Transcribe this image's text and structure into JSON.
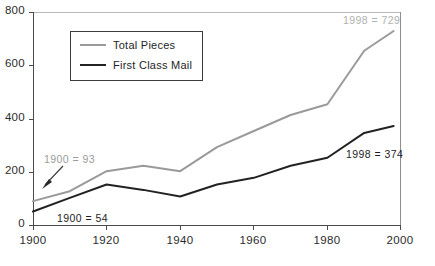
{
  "chart_data": {
    "type": "line",
    "title": "",
    "xlabel": "",
    "ylabel": "",
    "xlim": [
      1900,
      2000
    ],
    "ylim": [
      0,
      800
    ],
    "grid": false,
    "legend_position": "upper-left-inside",
    "x": [
      1900,
      1910,
      1920,
      1930,
      1940,
      1950,
      1960,
      1970,
      1980,
      1990,
      1998
    ],
    "xticks": [
      "1900",
      "1920",
      "1940",
      "1960",
      "1980",
      "2000"
    ],
    "xtick_values": [
      1900,
      1920,
      1940,
      1960,
      1980,
      2000
    ],
    "yticks": [
      "0",
      "200",
      "400",
      "600",
      "800"
    ],
    "ytick_values": [
      0,
      200,
      400,
      600,
      800
    ],
    "series": [
      {
        "name": "Total Pieces",
        "color": "#9a9a9a",
        "values": [
          93,
          130,
          205,
          225,
          205,
          295,
          355,
          415,
          455,
          655,
          729
        ]
      },
      {
        "name": "First Class Mail",
        "color": "#222222",
        "values": [
          54,
          105,
          155,
          135,
          110,
          155,
          180,
          225,
          255,
          348,
          374
        ]
      }
    ],
    "annotations": [
      {
        "id": "total-1998",
        "text": "1998 = 729",
        "color": "#b0b0b0",
        "series": "Total Pieces"
      },
      {
        "id": "total-1900",
        "text": "1900 = 93",
        "color": "#9b9b9b",
        "series": "Total Pieces",
        "arrow": true
      },
      {
        "id": "first-1900",
        "text": "1900 = 54",
        "color": "#1e1e1e",
        "series": "First Class Mail"
      },
      {
        "id": "first-1998",
        "text": "1998 = 374",
        "color": "#1e1e1e",
        "series": "First Class Mail"
      }
    ]
  },
  "legend": {
    "items": [
      {
        "label": "Total Pieces"
      },
      {
        "label": "First Class Mail"
      }
    ]
  },
  "axes": {
    "y": {
      "labels": [
        "800",
        "600",
        "400",
        "200",
        "0"
      ]
    },
    "x": {
      "labels": [
        "1900",
        "1920",
        "1940",
        "1960",
        "1980",
        "2000"
      ]
    }
  }
}
